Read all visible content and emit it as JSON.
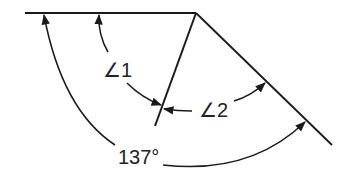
{
  "diagram": {
    "labels": {
      "angle1": "∠1",
      "angle2": "∠2",
      "total": "137°"
    },
    "colors": {
      "line": "#1a1a1a",
      "background": "#ffffff"
    }
  }
}
